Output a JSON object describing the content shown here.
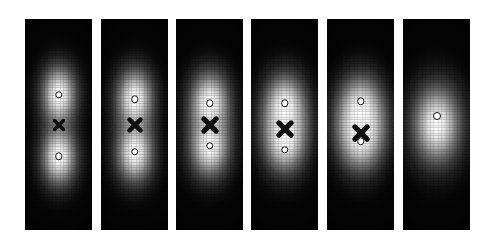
{
  "figure": {
    "background_color": "#ffffff",
    "panel_background_color": "#050505",
    "marker_circle_color": "#ffffff",
    "marker_circle_edge_color": "#101010",
    "marker_cross_color": "#101010",
    "width": 501,
    "height": 245,
    "panel_count": 6
  },
  "chart_data": {
    "type": "heatmap",
    "subtitle": "",
    "xlabel": "",
    "ylabel": "",
    "grid": false,
    "legend_position": "none",
    "colormap": "grayscale",
    "panel_width": 67,
    "panel_height": 211,
    "panel_top": 19,
    "panel_lefts": [
      25,
      101,
      176,
      251,
      327,
      403
    ],
    "panels": [
      {
        "index": 1,
        "label": "",
        "separation": 62,
        "merged": false,
        "blobs": [
          {
            "cx": 50,
            "cy": 36,
            "rx": 56,
            "ry": 30,
            "peak": 1.0
          },
          {
            "cx": 50,
            "cy": 65,
            "rx": 56,
            "ry": 30,
            "peak": 1.0
          }
        ],
        "markers": [
          {
            "type": "circle",
            "cx": 50,
            "cy": 36,
            "d": 7.5
          },
          {
            "type": "cross",
            "cx": 50,
            "cy": 50,
            "d": 13
          },
          {
            "type": "circle",
            "cx": 50,
            "cy": 65,
            "d": 7.5
          }
        ]
      },
      {
        "index": 2,
        "label": "",
        "separation": 52,
        "merged": false,
        "blobs": [
          {
            "cx": 50,
            "cy": 38,
            "rx": 60,
            "ry": 31,
            "peak": 1.0
          },
          {
            "cx": 50,
            "cy": 63,
            "rx": 60,
            "ry": 31,
            "peak": 1.0
          }
        ],
        "markers": [
          {
            "type": "circle",
            "cx": 50,
            "cy": 38,
            "d": 7.5
          },
          {
            "type": "cross",
            "cx": 50,
            "cy": 50,
            "d": 16
          },
          {
            "type": "circle",
            "cx": 50,
            "cy": 63,
            "d": 7.5
          }
        ]
      },
      {
        "index": 3,
        "label": "",
        "separation": 42,
        "merged": false,
        "blobs": [
          {
            "cx": 50,
            "cy": 40,
            "rx": 64,
            "ry": 32,
            "peak": 1.0
          },
          {
            "cx": 50,
            "cy": 60,
            "rx": 64,
            "ry": 32,
            "peak": 1.0
          }
        ],
        "markers": [
          {
            "type": "circle",
            "cx": 50,
            "cy": 40,
            "d": 7.5
          },
          {
            "type": "cross",
            "cx": 50,
            "cy": 50,
            "d": 18
          },
          {
            "type": "circle",
            "cx": 50,
            "cy": 60,
            "d": 7.5
          }
        ]
      },
      {
        "index": 4,
        "label": "",
        "separation": 30,
        "merged": true,
        "blobs": [
          {
            "cx": 50,
            "cy": 42,
            "rx": 68,
            "ry": 34,
            "peak": 1.0
          },
          {
            "cx": 50,
            "cy": 57,
            "rx": 68,
            "ry": 34,
            "peak": 1.0
          }
        ],
        "markers": [
          {
            "type": "circle",
            "cx": 50,
            "cy": 40,
            "d": 7.5
          },
          {
            "type": "cross",
            "cx": 50,
            "cy": 52,
            "d": 18
          },
          {
            "type": "circle",
            "cx": 50,
            "cy": 62,
            "d": 7.5
          }
        ]
      },
      {
        "index": 5,
        "label": "",
        "separation": 17,
        "merged": true,
        "blobs": [
          {
            "cx": 50,
            "cy": 44,
            "rx": 72,
            "ry": 36,
            "peak": 1.0
          },
          {
            "cx": 50,
            "cy": 55,
            "rx": 72,
            "ry": 36,
            "peak": 1.0
          }
        ],
        "markers": [
          {
            "type": "circle",
            "cx": 50,
            "cy": 39,
            "d": 7.5
          },
          {
            "type": "cross",
            "cx": 50,
            "cy": 54,
            "d": 18
          },
          {
            "type": "circle",
            "cx": 50,
            "cy": 58,
            "d": 7.5
          }
        ]
      },
      {
        "index": 6,
        "label": "",
        "separation": 0,
        "merged": true,
        "blobs": [
          {
            "cx": 50,
            "cy": 50,
            "rx": 78,
            "ry": 40,
            "peak": 1.0
          }
        ],
        "markers": [
          {
            "type": "circle",
            "cx": 50,
            "cy": 46,
            "d": 8
          }
        ]
      }
    ]
  }
}
